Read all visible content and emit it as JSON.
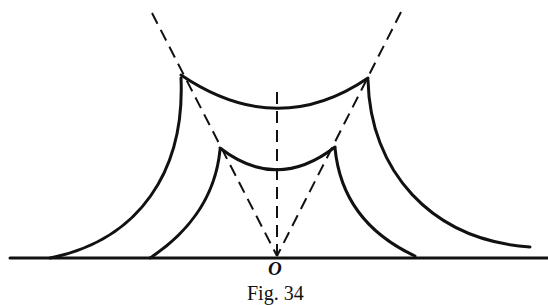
{
  "figure": {
    "origin_label": "O",
    "caption": "Fig. 34",
    "stroke_color": "#111111",
    "background": "#ffffff"
  }
}
